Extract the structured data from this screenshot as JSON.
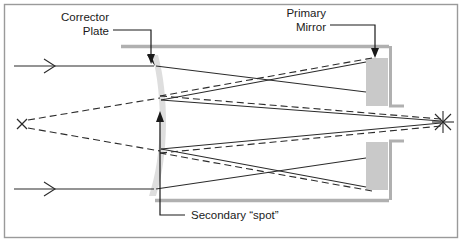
{
  "figure": {
    "type": "optical-ray-diagram",
    "width": 462,
    "height": 242,
    "background_color": "#ffffff",
    "border_color": "#9a9a9a"
  },
  "labels": {
    "corrector_plate": {
      "line1": "Corrector",
      "line2": "Plate"
    },
    "primary_mirror": {
      "line1": "Primary",
      "line2": "Mirror"
    },
    "secondary_spot": {
      "line1": "Secondary “spot”"
    }
  },
  "colors": {
    "ray_solid": "#2b2b2b",
    "ray_dashed": "#2b2b2b",
    "tube_gray": "#b0b0b0",
    "optic_gray": "#d4d4d4",
    "mirror_gray": "#c9c9c9",
    "leader_line": "#1a1a1a",
    "text": "#1a1a1a"
  },
  "components": {
    "corrector_plate": {
      "name": "corrector-plate",
      "x": 155,
      "top_y": 55,
      "bottom_y": 196
    },
    "primary_mirror_upper": {
      "name": "primary-mirror-upper",
      "x": 366,
      "y": 58,
      "w": 22,
      "h": 48
    },
    "primary_mirror_lower": {
      "name": "primary-mirror-lower",
      "x": 366,
      "y": 142,
      "w": 22,
      "h": 48
    },
    "focal_point_right": {
      "name": "focal-point-starburst",
      "x": 443,
      "y": 122
    },
    "virtual_focus_left": {
      "name": "virtual-focus-cross",
      "x": 22,
      "y": 124
    },
    "secondary_spot_upper": {
      "name": "secondary-spot-upper",
      "x": 160,
      "y": 100
    },
    "secondary_spot_lower": {
      "name": "secondary-spot-lower",
      "x": 160,
      "y": 149
    }
  },
  "rays": {
    "incoming_upper_y": 66,
    "incoming_lower_y": 189,
    "incoming_start_x": 14,
    "arrowhead_upper_x": 50,
    "arrowhead_lower_x": 50
  }
}
